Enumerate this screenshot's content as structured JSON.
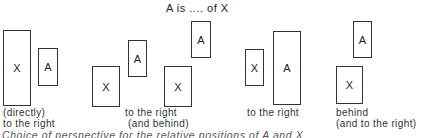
{
  "title": "A is .... of X",
  "panels": [
    {
      "boxes": [
        {
          "label": "X"
        },
        {
          "label": "A"
        }
      ],
      "caption_line1": "(directly)",
      "caption_line2": "to the right"
    },
    {
      "boxes": [
        {
          "label": "X"
        },
        {
          "label": "A"
        },
        {
          "label": "X"
        },
        {
          "label": "A"
        }
      ],
      "caption_line1": "to the right",
      "caption_line2": "(and behind)"
    },
    {
      "boxes": [
        {
          "label": "X"
        },
        {
          "label": "A"
        }
      ],
      "caption_line1": "to the right",
      "caption_line2": ""
    },
    {
      "boxes": [
        {
          "label": "A"
        },
        {
          "label": "X"
        }
      ],
      "caption_line1": "behind",
      "caption_line2": "(and to the right)"
    }
  ],
  "figure_caption": "Choice of perspective for the relative positions of A and X"
}
